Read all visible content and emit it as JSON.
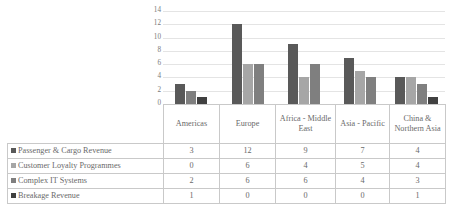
{
  "chart_data": {
    "type": "bar",
    "title": "",
    "xlabel": "",
    "ylabel": "",
    "ylim": [
      0,
      14
    ],
    "yticks": [
      14,
      12,
      10,
      8,
      6,
      4,
      2,
      0
    ],
    "grid": true,
    "legend_position": "table-left",
    "categories": [
      "Americas",
      "Europe",
      "Africa - Middle East",
      "Asia - Pacific",
      "China & Northern Asia"
    ],
    "series": [
      {
        "name": "Passenger & Cargo Revenue",
        "color": "#595959",
        "values": [
          3,
          12,
          9,
          7,
          4
        ]
      },
      {
        "name": "Customer Loyalty Programmes",
        "color": "#a6a6a6",
        "values": [
          0,
          6,
          4,
          5,
          4
        ]
      },
      {
        "name": "Complex IT Systems",
        "color": "#7f7f7f",
        "values": [
          2,
          6,
          6,
          4,
          3
        ]
      },
      {
        "name": "Breakage Revenue",
        "color": "#404040",
        "values": [
          1,
          0,
          0,
          0,
          1
        ]
      }
    ]
  },
  "table": {
    "category_cells": [
      "Americas",
      "Europe",
      "Africa - Middle East",
      "Asia - Pacific",
      "China & Northern Asia"
    ],
    "rows": [
      {
        "label": "Passenger & Cargo Revenue",
        "swatch": "#595959",
        "cells": [
          "3",
          "12",
          "9",
          "7",
          "4"
        ]
      },
      {
        "label": "Customer Loyalty Programmes",
        "swatch": "#a6a6a6",
        "cells": [
          "0",
          "6",
          "4",
          "5",
          "4"
        ]
      },
      {
        "label": "Complex IT Systems",
        "swatch": "#7f7f7f",
        "cells": [
          "2",
          "6",
          "6",
          "4",
          "3"
        ]
      },
      {
        "label": "Breakage Revenue",
        "swatch": "#404040",
        "cells": [
          "1",
          "0",
          "0",
          "0",
          "1"
        ]
      }
    ]
  }
}
